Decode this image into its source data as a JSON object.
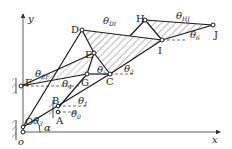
{
  "diagram": {
    "type": "planar linkage mechanism schematic",
    "axes": {
      "x_label": "x",
      "y_label": "y",
      "origin_label": "o"
    },
    "points": [
      {
        "id": "O",
        "label": "O",
        "x": 23,
        "y": 127
      },
      {
        "id": "A",
        "label": "A",
        "x": 58,
        "y": 112
      },
      {
        "id": "B",
        "label": "B",
        "x": 58,
        "y": 106
      },
      {
        "id": "C",
        "label": "C",
        "x": 110,
        "y": 74
      },
      {
        "id": "D",
        "label": "D",
        "x": 82,
        "y": 30
      },
      {
        "id": "E",
        "label": "E",
        "x": 94,
        "y": 53
      },
      {
        "id": "F",
        "label": "F",
        "x": 21,
        "y": 86
      },
      {
        "id": "G",
        "label": "G",
        "x": 87,
        "y": 74
      },
      {
        "id": "H",
        "label": "H",
        "x": 145,
        "y": 20
      },
      {
        "id": "I",
        "label": "I",
        "x": 162,
        "y": 40
      },
      {
        "id": "J",
        "label": "J",
        "x": 213,
        "y": 25
      }
    ],
    "angle_labels": [
      {
        "id": "theta_DI",
        "main": "θ",
        "sub": "DI"
      },
      {
        "id": "theta_HJ",
        "main": "θ",
        "sub": "HJ"
      },
      {
        "id": "theta_6",
        "main": "θ",
        "sub": "6"
      },
      {
        "id": "theta_EF",
        "main": "θ",
        "sub": "EF"
      },
      {
        "id": "theta_5",
        "main": "θ",
        "sub": "5"
      },
      {
        "id": "theta_2",
        "main": "θ",
        "sub": "2"
      },
      {
        "id": "theta_4",
        "main": "θ",
        "sub": "4"
      },
      {
        "id": "theta_1",
        "main": "θ",
        "sub": "1"
      },
      {
        "id": "theta_0",
        "main": "θ",
        "sub": "0"
      },
      {
        "id": "theta_3",
        "main": "θ",
        "sub": "3"
      },
      {
        "id": "alpha",
        "main": "α",
        "sub": ""
      }
    ],
    "colors": {
      "line": "#1a1a1a",
      "background": "#ffffff"
    }
  }
}
